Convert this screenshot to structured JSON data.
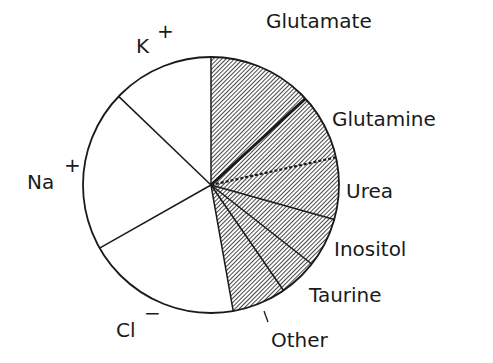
{
  "chart_data": {
    "type": "pie",
    "title": "",
    "start_angle_deg": 0,
    "direction": "clockwise",
    "center": [
      211,
      185
    ],
    "radius": 128,
    "units": "degrees of 360 (estimated from slice boundaries); percent also given",
    "slices": [
      {
        "label": "Glutamate",
        "sup": "",
        "degrees": 47.5,
        "percent": 13.2,
        "fill": "hatched",
        "boundary_style": "thick"
      },
      {
        "label": "Glutamine",
        "sup": "",
        "degrees": 30.0,
        "percent": 8.3,
        "fill": "hatched",
        "boundary_style": "dotted"
      },
      {
        "label": "Urea",
        "sup": "",
        "degrees": 28.1,
        "percent": 7.8,
        "fill": "hatched",
        "boundary_style": "solid"
      },
      {
        "label": "Inositol",
        "sup": "",
        "degrees": 22.5,
        "percent": 6.3,
        "fill": "hatched",
        "boundary_style": "solid"
      },
      {
        "label": "Taurine",
        "sup": "",
        "degrees": 17.4,
        "percent": 4.8,
        "fill": "hatched",
        "boundary_style": "solid"
      },
      {
        "label": "Other",
        "sup": "",
        "degrees": 24.5,
        "percent": 6.8,
        "fill": "hatched",
        "boundary_style": "solid"
      },
      {
        "label": "Cl",
        "sup": "−",
        "degrees": 70.5,
        "percent": 19.6,
        "fill": "white",
        "boundary_style": "solid"
      },
      {
        "label": "Na",
        "sup": "+",
        "degrees": 73.3,
        "percent": 20.4,
        "fill": "white",
        "boundary_style": "solid"
      },
      {
        "label": "K",
        "sup": "+",
        "degrees": 46.2,
        "percent": 12.8,
        "fill": "white",
        "boundary_style": "solid"
      }
    ],
    "groups": [
      {
        "name": "organic osmolytes",
        "fill": "hatched",
        "members": [
          "Glutamate",
          "Glutamine",
          "Urea",
          "Inositol",
          "Taurine",
          "Other"
        ]
      },
      {
        "name": "inorganic ions",
        "fill": "white",
        "members": [
          "Cl",
          "Na",
          "K"
        ]
      }
    ],
    "legend": "none (direct labels)",
    "grid": false
  },
  "labels": {
    "glutamate": "Glutamate",
    "glutamine": "Glutamine",
    "urea": "Urea",
    "inositol": "Inositol",
    "taurine": "Taurine",
    "other": "Other",
    "cl": "Cl",
    "cl_sup": "−",
    "na": "Na",
    "na_sup": "+",
    "k": "K",
    "k_sup": "+"
  },
  "colors": {
    "ink": "#1a1a1a",
    "background": "#ffffff",
    "hatch": "#1a1a1a"
  }
}
